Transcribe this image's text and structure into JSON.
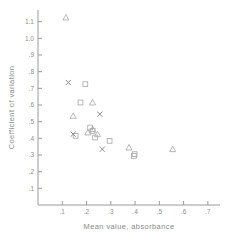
{
  "chart_data": {
    "type": "scatter",
    "title": "",
    "xlabel": "Mean  value, absorbance",
    "ylabel": "Coefficient of variation",
    "xlim": [
      0.0,
      0.75
    ],
    "ylim": [
      0.0,
      1.17
    ],
    "grid": false,
    "legend": "none",
    "xticks": [
      ".1",
      ".2",
      ".3",
      ".4",
      ".5",
      ".6",
      ".7"
    ],
    "xtick_values": [
      0.1,
      0.2,
      0.3,
      0.4,
      0.5,
      0.6,
      0.7
    ],
    "yticks": [
      ".1",
      ".2",
      ".3",
      ".4",
      ".5",
      ".6",
      ".7",
      ".8",
      ".9",
      "1.0",
      "1.1"
    ],
    "ytick_values": [
      0.1,
      0.2,
      0.3,
      0.4,
      0.5,
      0.6,
      0.7,
      0.8,
      0.9,
      1.0,
      1.1
    ],
    "series": [
      {
        "name": "triangle",
        "marker": "triangle",
        "points": [
          {
            "x": 0.115,
            "y": 1.125
          },
          {
            "x": 0.145,
            "y": 0.535
          },
          {
            "x": 0.225,
            "y": 0.615
          },
          {
            "x": 0.205,
            "y": 0.435
          },
          {
            "x": 0.225,
            "y": 0.455
          },
          {
            "x": 0.245,
            "y": 0.425
          },
          {
            "x": 0.375,
            "y": 0.345
          },
          {
            "x": 0.555,
            "y": 0.335
          }
        ]
      },
      {
        "name": "square-circle",
        "marker": "square",
        "points": [
          {
            "x": 0.195,
            "y": 0.725
          },
          {
            "x": 0.175,
            "y": 0.615
          },
          {
            "x": 0.155,
            "y": 0.415
          },
          {
            "x": 0.215,
            "y": 0.465
          },
          {
            "x": 0.225,
            "y": 0.445
          },
          {
            "x": 0.235,
            "y": 0.405
          },
          {
            "x": 0.295,
            "y": 0.385
          },
          {
            "x": 0.395,
            "y": 0.295
          },
          {
            "x": 0.398,
            "y": 0.305
          }
        ]
      },
      {
        "name": "cross",
        "marker": "x",
        "points": [
          {
            "x": 0.125,
            "y": 0.735
          },
          {
            "x": 0.255,
            "y": 0.545
          },
          {
            "x": 0.145,
            "y": 0.425
          },
          {
            "x": 0.265,
            "y": 0.335
          }
        ]
      }
    ]
  },
  "axes": {
    "x_title": "Mean  value, absorbance",
    "y_title": "Coefficient of variation"
  }
}
